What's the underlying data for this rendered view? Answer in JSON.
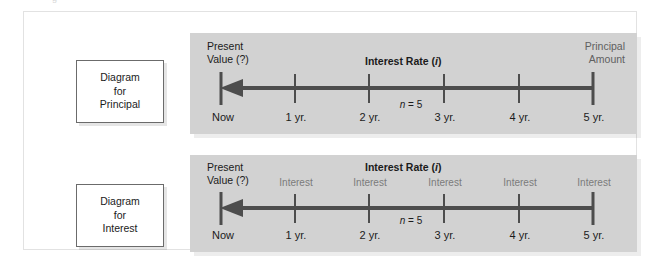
{
  "figure": {
    "clipped_caption": "g",
    "panels": [
      {
        "id": "principal",
        "side_label_lines": [
          "Diagram",
          "for",
          "Principal"
        ],
        "present_value_lines": [
          "Present",
          "Value (?)"
        ],
        "interest_rate_label": "Interest Rate (",
        "interest_rate_symbol": "i",
        "interest_rate_label_close": ")",
        "corner_label_lines": [
          "Principal",
          "Amount"
        ],
        "n_label_prefix": "",
        "n_label_symbol": "n",
        "n_label_value": " = 5",
        "tick_labels": [
          "Now",
          "1 yr.",
          "2 yr.",
          "3 yr.",
          "4 yr.",
          "5 yr."
        ],
        "interest_labels": []
      },
      {
        "id": "interest",
        "side_label_lines": [
          "Diagram",
          "for",
          "Interest"
        ],
        "present_value_lines": [
          "Present",
          "Value (?)"
        ],
        "interest_rate_label": "Interest Rate (",
        "interest_rate_symbol": "i",
        "interest_rate_label_close": ")",
        "corner_label_lines": [],
        "n_label_prefix": "",
        "n_label_symbol": "n",
        "n_label_value": " = 5",
        "tick_labels": [
          "Now",
          "1 yr.",
          "2 yr.",
          "3 yr.",
          "4 yr.",
          "5 yr."
        ],
        "interest_labels": [
          "Interest",
          "Interest",
          "Interest",
          "Interest",
          "Interest"
        ]
      }
    ]
  },
  "colors": {
    "panel_background": "#d2d2d2",
    "axis_line": "#4d4d4d",
    "text_primary": "#1b1b1b",
    "text_muted": "#7b7b7b",
    "frame_border": "#e2e2e2"
  }
}
